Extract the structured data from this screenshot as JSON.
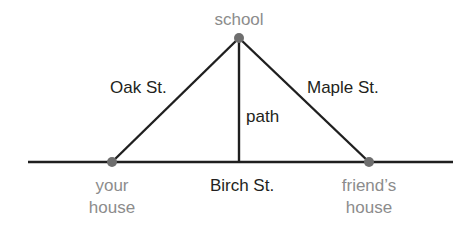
{
  "diagram": {
    "colors": {
      "line": "#1f1f1f",
      "dot": "#6e6e6e",
      "place_label": "#8c8c8c",
      "street_label": "#231f20",
      "background": "#ffffff"
    },
    "places": {
      "school": {
        "label": "school",
        "x": 239,
        "y": 38
      },
      "your_house": {
        "label_line1": "your",
        "label_line2": "house",
        "x": 112,
        "y": 162
      },
      "friends_house": {
        "label_line1": "friend’s",
        "label_line2": "house",
        "x": 369,
        "y": 162
      }
    },
    "streets": {
      "oak": "Oak St.",
      "maple": "Maple St.",
      "birch": "Birch St.",
      "path": "path"
    },
    "baseline": {
      "x1": 28,
      "x2": 453,
      "y": 162
    }
  }
}
